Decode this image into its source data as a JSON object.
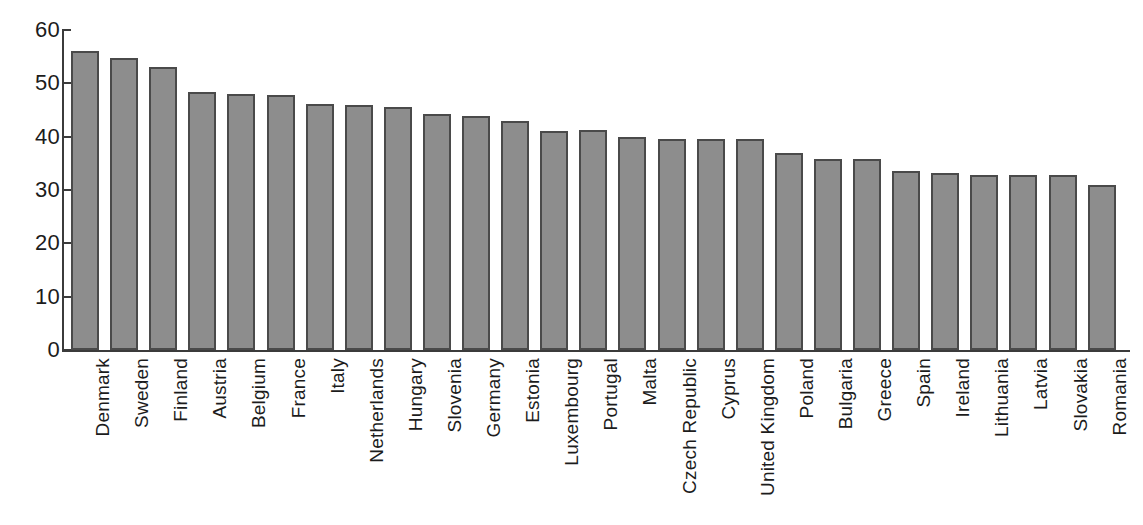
{
  "chart_data": {
    "type": "bar",
    "title": "",
    "subtitle": "",
    "xlabel": "",
    "ylabel": "",
    "ylim": [
      0,
      60
    ],
    "yticks": [
      0,
      10,
      20,
      30,
      40,
      50,
      60
    ],
    "ytick_labels": [
      "0",
      "10",
      "20",
      "30",
      "40",
      "50",
      "60"
    ],
    "grid": false,
    "legend": false,
    "legend_position": "none",
    "bar_fill_color": "#8d8d8d",
    "bar_edge_color": "#4a4a4a",
    "axis_color": "#3b3b3b",
    "background_color": "#ffffff",
    "categories": [
      "Denmark",
      "Sweden",
      "Finland",
      "Austria",
      "Belgium",
      "France",
      "Italy",
      "Netherlands",
      "Hungary",
      "Slovenia",
      "Germany",
      "Estonia",
      "Luxembourg",
      "Portugal",
      "Malta",
      "Czech Republic",
      "Cyprus",
      "United Kingdom",
      "Poland",
      "Bulgaria",
      "Greece",
      "Spain",
      "Ireland",
      "Lithuania",
      "Latvia",
      "Slovakia",
      "Romania"
    ],
    "values": [
      56.0,
      54.8,
      53.0,
      48.4,
      48.0,
      47.8,
      46.2,
      46.0,
      45.5,
      44.2,
      43.8,
      43.0,
      41.1,
      41.2,
      40.0,
      39.6,
      39.6,
      39.6,
      36.9,
      35.9,
      35.8,
      33.5,
      33.1,
      32.8,
      32.9,
      32.9,
      31.0
    ]
  }
}
